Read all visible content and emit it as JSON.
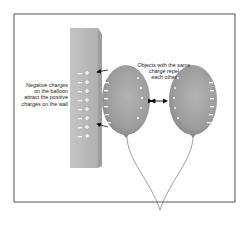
{
  "diagram": {
    "labels": {
      "wall_attraction": [
        "Negative charges",
        "on the balloon",
        "attract the positive",
        "charges on the wall"
      ],
      "repulsion": [
        "Objects with the same",
        "charge repel",
        "each other"
      ]
    },
    "elements": {
      "wall": {
        "fill": "#b8b8b8",
        "positive_charge_count": 8,
        "negative_charge_count": 8
      },
      "balloon_left": {
        "fill": "#9e9e9e",
        "charge": "negative"
      },
      "balloon_right": {
        "fill": "#9e9e9e",
        "charge": "negative"
      },
      "strings": {
        "color": "#777777"
      }
    },
    "colors": {
      "frame": "#555555",
      "text": "#222222",
      "charge_marks": "#ffffff"
    }
  }
}
